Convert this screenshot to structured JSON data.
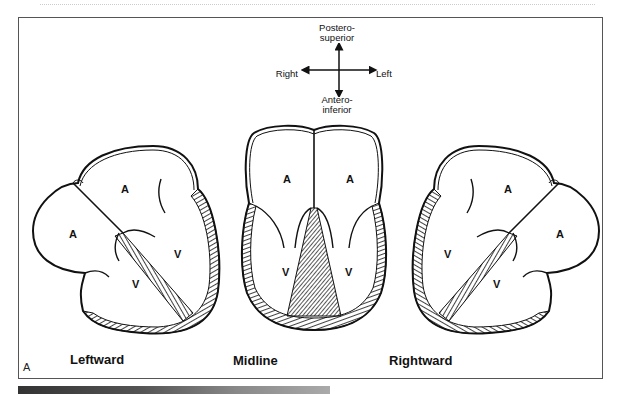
{
  "figure": {
    "panel_label": "A",
    "orientation": {
      "top": "Postero-\nsuperior",
      "top_line1": "Postero-",
      "top_line2": "superior",
      "left": "Right",
      "right": "Left",
      "bottom_line1": "Antero-",
      "bottom_line2": "inferior"
    },
    "hearts": [
      {
        "caption": "Leftward",
        "chambers": [
          "A",
          "A",
          "V",
          "V"
        ]
      },
      {
        "caption": "Midline",
        "chambers": [
          "A",
          "A",
          "V",
          "V"
        ]
      },
      {
        "caption": "Rightward",
        "chambers": [
          "A",
          "A",
          "V",
          "V"
        ]
      }
    ]
  },
  "colors": {
    "line": "#111111",
    "frame": "#555555",
    "background": "#ffffff"
  }
}
